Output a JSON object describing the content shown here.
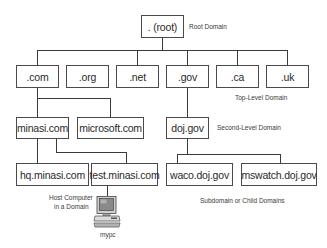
{
  "diagram": {
    "type": "DNS namespace hierarchy",
    "root": {
      "label": ". (root)",
      "annotation": "Root Domain"
    },
    "top_level": {
      "annotation": "Top-Level Domain",
      "nodes": [
        ".com",
        ".org",
        ".net",
        ".gov",
        ".ca",
        ".uk"
      ]
    },
    "second_level": {
      "annotation": "Second-Level Domain",
      "nodes": [
        {
          "label": "minasi.com",
          "parent": ".com"
        },
        {
          "label": "microsoft.com",
          "parent": ".com"
        },
        {
          "label": "doj.gov",
          "parent": ".gov"
        }
      ]
    },
    "subdomains": {
      "annotation": "Subdomain or Child Domains",
      "nodes": [
        {
          "label": "hq.minasi.com",
          "parent": "minasi.com"
        },
        {
          "label": "test.minasi.com",
          "parent": "minasi.com"
        },
        {
          "label": "waco.doj.gov",
          "parent": "doj.gov"
        },
        {
          "label": "mswatch.doj.gov",
          "parent": "doj.gov"
        }
      ]
    },
    "host": {
      "label": "mypc",
      "parent": "test.minasi.com",
      "annotation_line1": "Host Computer",
      "annotation_line2": "in a Domain",
      "icon": "computer-icon"
    }
  }
}
